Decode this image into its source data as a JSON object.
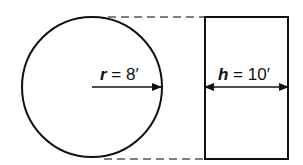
{
  "diagram": {
    "circle": {
      "radius_label_var": "r",
      "radius_label_eq": " = 8′"
    },
    "rectangle": {
      "height_label_var": "h",
      "height_label_eq": " = 10′"
    },
    "colors": {
      "stroke": "#111111",
      "dash": "#555555",
      "background": "#ffffff"
    }
  }
}
